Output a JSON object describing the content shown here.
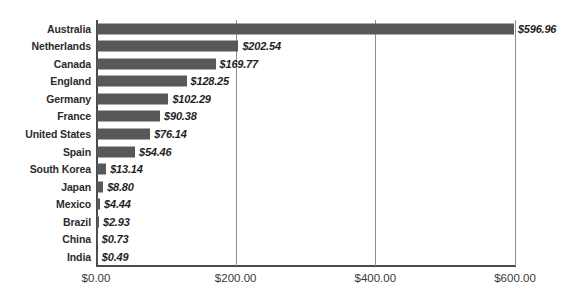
{
  "chart_data": {
    "type": "bar",
    "orientation": "horizontal",
    "title": "",
    "subtitle": "",
    "xlabel": "",
    "ylabel": "",
    "categories": [
      "Australia",
      "Netherlands",
      "Canada",
      "England",
      "Germany",
      "France",
      "United States",
      "Spain",
      "South Korea",
      "Japan",
      "Mexico",
      "Brazil",
      "China",
      "India"
    ],
    "values": [
      596.96,
      202.54,
      169.77,
      128.25,
      102.29,
      90.38,
      76.14,
      54.46,
      13.14,
      8.8,
      4.44,
      2.93,
      0.73,
      0.49
    ],
    "data_labels": [
      "$596.96",
      "$202.54",
      "$169.77",
      "$128.25",
      "$102.29",
      "$90.38",
      "$76.14",
      "$54.46",
      "$13.14",
      "$8.80",
      "$4.44",
      "$2.93",
      "$0.73",
      "$0.49"
    ],
    "xlim": [
      0,
      600
    ],
    "xticks": [
      0,
      200,
      400,
      600
    ],
    "xtick_labels": [
      "$0.00",
      "$200.00",
      "$400.00",
      "$600.00"
    ],
    "grid": true,
    "grid_axis": "x",
    "legend": false,
    "legend_position": "none",
    "bar_color": "#585858",
    "axis_color": "#4b4b4b",
    "gridline_color": "#8e8e8e",
    "label_color": "#2b2b2b",
    "value_label_color": "#1f1f1f"
  }
}
